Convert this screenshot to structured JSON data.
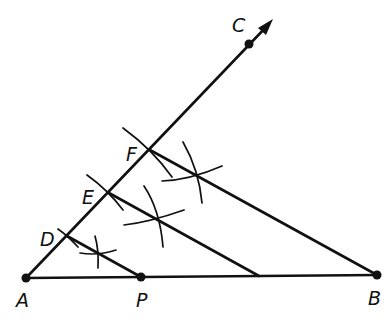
{
  "diagram": {
    "type": "geometric-construction",
    "points": {
      "A": {
        "label": "A",
        "x": 26,
        "y": 278
      },
      "P": {
        "label": "P",
        "x": 141,
        "y": 277
      },
      "B": {
        "label": "B",
        "x": 377,
        "y": 275
      },
      "C": {
        "label": "C",
        "x": 249,
        "y": 44
      },
      "D": {
        "label": "D",
        "x": 67,
        "y": 236
      },
      "E": {
        "label": "E",
        "x": 109,
        "y": 193
      },
      "F": {
        "label": "F",
        "x": 150,
        "y": 150
      }
    },
    "segments": [
      {
        "name": "AB",
        "from": "A",
        "to": "B"
      },
      {
        "name": "ray-AC",
        "from": "A",
        "to": "C",
        "arrow": true
      },
      {
        "name": "DP",
        "from": "D",
        "to": "P"
      },
      {
        "name": "E-parallel",
        "from": "E",
        "to_xy": [
          259,
          276
        ]
      },
      {
        "name": "FB",
        "from": "F",
        "to": "B"
      }
    ],
    "labels": [
      "A",
      "P",
      "B",
      "C",
      "D",
      "E",
      "F"
    ],
    "colors": {
      "ink": "#111111",
      "background": "#ffffff"
    }
  }
}
